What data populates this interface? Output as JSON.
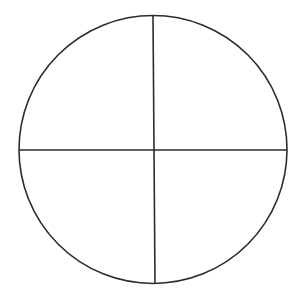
{
  "diagram": {
    "type": "circle-divided-into-quadrants",
    "quadrant_count": 4,
    "stroke_color": "#2b2b2b",
    "background_color": "#ffffff",
    "circle": {
      "cx": 153,
      "cy": 149.5,
      "r": 134
    },
    "vertical_line": {
      "x1": 153,
      "y1": 15,
      "x2": 155,
      "y2": 284
    },
    "horizontal_line": {
      "x1": 19,
      "y1": 150,
      "x2": 287,
      "y2": 150
    }
  }
}
